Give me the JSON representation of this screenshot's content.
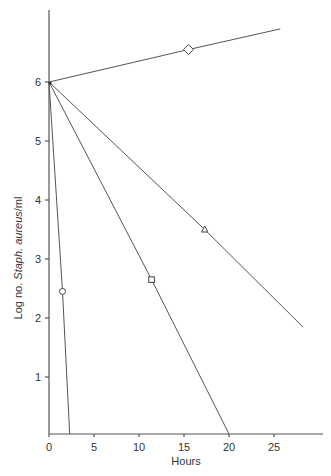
{
  "chart_data": {
    "type": "line",
    "title": "",
    "xlabel": "Hours",
    "ylabel": "Log no. Staph. aureus/ml",
    "ylabel_parts": {
      "prefix": "Log no. ",
      "italic": "Staph. aureus",
      "suffix": "/ml"
    },
    "xlim": [
      0,
      30
    ],
    "ylim": [
      0,
      7
    ],
    "x_ticks": [
      0,
      5,
      10,
      15,
      20,
      25
    ],
    "y_ticks": [
      1,
      2,
      3,
      4,
      5,
      6
    ],
    "grid": false,
    "legend": null,
    "series": [
      {
        "name": "diamond",
        "marker": "diamond",
        "x": [
          0,
          15.5,
          25.7
        ],
        "y": [
          6,
          6.55,
          6.9
        ],
        "marker_point": [
          15.5,
          6.55
        ]
      },
      {
        "name": "triangle",
        "marker": "triangle",
        "x": [
          0,
          17.3,
          28.2
        ],
        "y": [
          6,
          3.5,
          1.85
        ],
        "marker_point": [
          17.3,
          3.5
        ]
      },
      {
        "name": "square",
        "marker": "square",
        "x": [
          0,
          11.4,
          20
        ],
        "y": [
          6,
          2.65,
          0
        ],
        "marker_point": [
          11.4,
          2.65
        ]
      },
      {
        "name": "circle",
        "marker": "circle",
        "x": [
          0,
          1.5,
          2.3
        ],
        "y": [
          6,
          2.45,
          0
        ],
        "marker_point": [
          1.5,
          2.45
        ]
      }
    ]
  }
}
